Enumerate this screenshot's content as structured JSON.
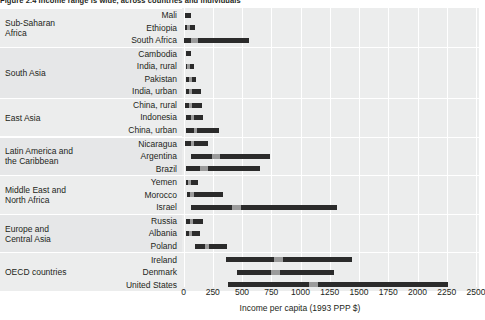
{
  "figure": {
    "title": "Figure 2.4 Income range is wide, across countries and individuals"
  },
  "chart_data": {
    "type": "bar",
    "subtype": "range-bars-with-median-marker",
    "title": "Figure 2.4 Income range is wide, across countries and individuals",
    "xlabel": "Income per capita (1993 PPP $)",
    "ylabel": "",
    "xlim": [
      0,
      2500
    ],
    "xticks": [
      0,
      250,
      500,
      750,
      1000,
      1250,
      1500,
      1750,
      2000,
      2250,
      2500
    ],
    "xtick_labels": [
      "0",
      "250",
      "500",
      "750",
      "1000",
      "1250",
      "1500",
      "1750",
      "2000",
      "2250",
      "2500"
    ],
    "grid": true,
    "grid_axis": "x",
    "legend": null,
    "colors": {
      "bar": "#2b2b2b",
      "median": "#9b9b9b",
      "band": "#eceded",
      "band_alt": "#e6e7e8",
      "gridline": "#ffffff",
      "text": "#231f20"
    },
    "groups": [
      {
        "name": "Sub-Saharan Africa",
        "rows": [
          {
            "label": "Mali",
            "low": 15,
            "high": 60,
            "median": 30
          },
          {
            "label": "Ethiopia",
            "low": 10,
            "high": 95,
            "median": 40
          },
          {
            "label": "South Africa",
            "low": 0,
            "high": 560,
            "median": 95
          }
        ]
      },
      {
        "name": "South Asia",
        "rows": [
          {
            "label": "Cambodia",
            "low": 20,
            "high": 65,
            "median": 35
          },
          {
            "label": "India, rural",
            "low": 20,
            "high": 90,
            "median": 45
          },
          {
            "label": "Pakistan",
            "low": 25,
            "high": 110,
            "median": 60
          },
          {
            "label": "India, urban",
            "low": 20,
            "high": 150,
            "median": 60
          }
        ]
      },
      {
        "name": "East Asia",
        "rows": [
          {
            "label": "China, rural",
            "low": 15,
            "high": 160,
            "median": 60
          },
          {
            "label": "Indonesia",
            "low": 20,
            "high": 170,
            "median": 75
          },
          {
            "label": "China, urban",
            "low": 20,
            "high": 300,
            "median": 105
          }
        ]
      },
      {
        "name": "Latin America and the Caribbean",
        "rows": [
          {
            "label": "Nicaragua",
            "low": 15,
            "high": 210,
            "median": 80
          },
          {
            "label": "Argentina",
            "low": 60,
            "high": 740,
            "median": 275
          },
          {
            "label": "Brazil",
            "low": 20,
            "high": 655,
            "median": 175
          }
        ]
      },
      {
        "name": "Middle East and North Africa",
        "rows": [
          {
            "label": "Yemen",
            "low": 20,
            "high": 120,
            "median": 55
          },
          {
            "label": "Morocco",
            "low": 30,
            "high": 335,
            "median": 75
          },
          {
            "label": "Israel",
            "low": 60,
            "high": 1310,
            "median": 455
          }
        ]
      },
      {
        "name": "Europe and Central Asia",
        "rows": [
          {
            "label": "Russia",
            "low": 20,
            "high": 165,
            "median": 70
          },
          {
            "label": "Albania",
            "low": 20,
            "high": 140,
            "median": 60
          },
          {
            "label": "Poland",
            "low": 95,
            "high": 375,
            "median": 200
          }
        ]
      },
      {
        "name": "OECD countries",
        "rows": [
          {
            "label": "Ireland",
            "low": 360,
            "high": 1440,
            "median": 810
          },
          {
            "label": "Denmark",
            "low": 460,
            "high": 1285,
            "median": 790
          },
          {
            "label": "United States",
            "low": 380,
            "high": 2260,
            "median": 1110
          }
        ]
      }
    ]
  }
}
